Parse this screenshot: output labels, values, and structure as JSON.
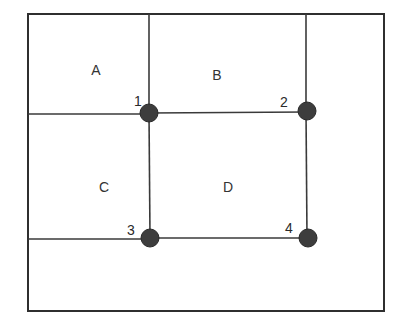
{
  "diagram": {
    "type": "planar-grid-partition",
    "frame": {
      "x1": 28,
      "y1": 14,
      "x2": 384,
      "y2": 311
    },
    "colors": {
      "line": "#3a3a3a",
      "node_fill": "#3d3d3d",
      "text": "#333333",
      "background": "#ffffff"
    },
    "regions": [
      {
        "id": "A",
        "label": "A",
        "x": 96,
        "y": 75
      },
      {
        "id": "B",
        "label": "B",
        "x": 217,
        "y": 80
      },
      {
        "id": "C",
        "label": "C",
        "x": 104,
        "y": 192
      },
      {
        "id": "D",
        "label": "D",
        "x": 228,
        "y": 192
      }
    ],
    "nodes": [
      {
        "id": "1",
        "label": "1",
        "cx": 149,
        "cy": 113,
        "lx": 134,
        "ly": 106
      },
      {
        "id": "2",
        "label": "2",
        "cx": 307,
        "cy": 111,
        "lx": 280,
        "ly": 107
      },
      {
        "id": "3",
        "label": "3",
        "cx": 150,
        "cy": 238,
        "lx": 127,
        "ly": 235
      },
      {
        "id": "4",
        "label": "4",
        "cx": 308,
        "cy": 238,
        "lx": 285,
        "ly": 233
      }
    ],
    "edges": [
      {
        "from": "top",
        "to": "1",
        "x1": 149,
        "y1": 14,
        "x2": 149,
        "y2": 113
      },
      {
        "from": "top",
        "to": "2",
        "x1": 306,
        "y1": 14,
        "x2": 306,
        "y2": 111
      },
      {
        "from": "left",
        "to": "1",
        "x1": 28,
        "y1": 114,
        "x2": 149,
        "y2": 114
      },
      {
        "from": "1",
        "to": "2",
        "x1": 149,
        "y1": 113,
        "x2": 307,
        "y2": 112
      },
      {
        "from": "1",
        "to": "3",
        "x1": 149,
        "y1": 113,
        "x2": 150,
        "y2": 238
      },
      {
        "from": "2",
        "to": "4",
        "x1": 306,
        "y1": 111,
        "x2": 307,
        "y2": 238
      },
      {
        "from": "left",
        "to": "3",
        "x1": 28,
        "y1": 239,
        "x2": 150,
        "y2": 239
      },
      {
        "from": "3",
        "to": "4",
        "x1": 150,
        "y1": 238,
        "x2": 308,
        "y2": 238
      }
    ],
    "node_radius": 9
  }
}
